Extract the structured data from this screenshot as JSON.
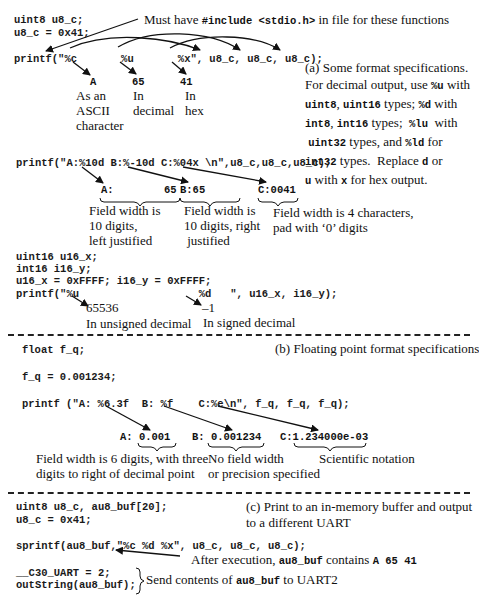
{
  "section_a": {
    "code": {
      "line1": "uint8 u8_c;",
      "line2": "u8_c = 0x41;",
      "line3": "printf(\"%c       %u       %x\", u8_c, u8_c, u8_c);"
    },
    "include_note": {
      "pre": "Must have ",
      "code": "#include <stdio.h>",
      "post": " in file for these functions"
    },
    "outputs": [
      {
        "value": "A",
        "label_lines": [
          "As an",
          "ASCII",
          "character"
        ]
      },
      {
        "value": "65",
        "label_lines": [
          "In",
          "decimal"
        ]
      },
      {
        "value": "41",
        "label_lines": [
          "In",
          "hex"
        ]
      }
    ],
    "caption_lines": [
      {
        "parts": [
          {
            "t": "(a) Some format specifications."
          }
        ]
      },
      {
        "parts": [
          {
            "t": "For decimal output, use "
          },
          {
            "c": "%u"
          },
          {
            "t": " with"
          }
        ]
      },
      {
        "parts": [
          {
            "c": "uint8"
          },
          {
            "t": ", "
          },
          {
            "c": "uint16"
          },
          {
            "t": " types; "
          },
          {
            "c": "%d"
          },
          {
            "t": " with"
          }
        ]
      },
      {
        "parts": [
          {
            "c": "int8"
          },
          {
            "t": ", "
          },
          {
            "c": "int16"
          },
          {
            "t": " types;  "
          },
          {
            "c": "%lu"
          },
          {
            "t": "  with"
          }
        ]
      },
      {
        "parts": [
          {
            "t": " "
          },
          {
            "c": "uint32"
          },
          {
            "t": " types, and "
          },
          {
            "c": "%ld"
          },
          {
            "t": " for"
          }
        ]
      },
      {
        "parts": [
          {
            "c": "int32"
          },
          {
            "t": " types.  Replace "
          },
          {
            "c": "d"
          },
          {
            "t": " or"
          }
        ]
      },
      {
        "parts": [
          {
            "c": "u"
          },
          {
            "t": " with "
          },
          {
            "c": "x"
          },
          {
            "t": " for hex output."
          }
        ]
      }
    ],
    "width_example": {
      "code": "printf(\"A:%10d B:%-10d C:%04x \\n\",u8_c,u8_c,u8_c);",
      "outputs": {
        "a": "A:        65",
        "b": "B:65",
        "c": "C:0041"
      },
      "notes": {
        "a": [
          "Field width is",
          "10 digits,",
          "left justified"
        ],
        "b": [
          "Field width is",
          "10 digits, right",
          " justified"
        ],
        "c": [
          "Field width is 4 characters,",
          "pad with ‘0’ digits"
        ]
      }
    },
    "signed_example": {
      "code": {
        "line1": "uint16 u16_x;",
        "line2": "int16 i16_y;",
        "line3": "u16_x = 0xFFFF; i16_y = 0xFFFF;",
        "line4": "printf(\"%u                   %d   \", u16_x, i16_y);"
      },
      "outputs": {
        "u": "65536",
        "d": "–1"
      },
      "notes": {
        "u": "In unsigned decimal",
        "d": "In signed decimal"
      }
    }
  },
  "section_b": {
    "code": {
      "line1": "float f_q;",
      "line2": "f_q = 0.001234;",
      "line3": "printf (\"A: %6.3f  B: %f    C:%e\\n\", f_q, f_q, f_q);"
    },
    "caption": "(b) Floating point format specifications",
    "outputs": {
      "a_label": "A: ",
      "a_val": "0.001",
      "b_label": "B: ",
      "b_val": "0.001234",
      "c_label": "C:",
      "c_val": "1.234000e-03"
    },
    "notes": {
      "a": [
        "Field width is 6 digits, with three",
        "digits to right of decimal point"
      ],
      "b": [
        "No field width",
        "or precision specified"
      ],
      "c": [
        "Scientific notation"
      ]
    }
  },
  "section_c": {
    "code": {
      "line1": "uint8 u8_c, au8_buf[20];",
      "line2": "u8_c = 0x41;",
      "line3": "sprintf(au8_buf,\"%c %d %x\", u8_c, u8_c, u8_c);",
      "line4": "__C30_UART = 2;",
      "line5": "outString(au8_buf);"
    },
    "caption_lines": [
      "(c) Print to an in-memory buffer and output",
      "to a different UART"
    ],
    "after_note": {
      "pre": "After execution, ",
      "code1": "au8_buf",
      "mid": " contains ",
      "code2": "A 65 41"
    },
    "send_note": {
      "pre": "Send contents of ",
      "code": "au8_buf",
      "post": " to UART2"
    }
  }
}
